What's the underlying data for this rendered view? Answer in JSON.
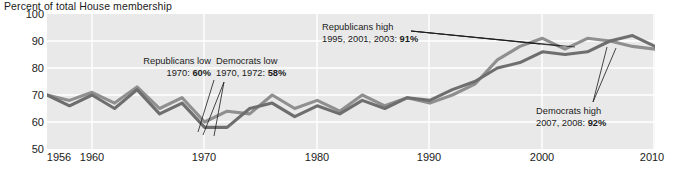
{
  "chart_data": {
    "type": "line",
    "title": "Percent of total House membership",
    "xlabel": "",
    "ylabel": "Percent of total House membership",
    "ylim": [
      50,
      100
    ],
    "xlim": [
      1956,
      2010
    ],
    "yticks": [
      100,
      90,
      80,
      70,
      60,
      50
    ],
    "xticks": [
      1956,
      1960,
      1970,
      1980,
      1990,
      2000,
      2010
    ],
    "grid": true,
    "legend": "none",
    "background": "#e9e9e9",
    "gridline_color": "#ffffff",
    "series": [
      {
        "name": "Republicans",
        "color": "#8f8f8f",
        "x": [
          1956,
          1958,
          1960,
          1962,
          1964,
          1966,
          1968,
          1970,
          1972,
          1974,
          1976,
          1978,
          1980,
          1982,
          1984,
          1986,
          1988,
          1990,
          1992,
          1994,
          1996,
          1998,
          2000,
          2002,
          2004,
          2006,
          2008,
          2010
        ],
        "values": [
          70,
          68,
          71,
          67,
          73,
          65,
          69,
          60,
          64,
          63,
          70,
          65,
          68,
          64,
          70,
          66,
          69,
          67,
          70,
          74,
          83,
          88,
          91,
          87,
          91,
          90,
          88,
          87
        ]
      },
      {
        "name": "Democrats",
        "color": "#6e6e6e",
        "x": [
          1956,
          1958,
          1960,
          1962,
          1964,
          1966,
          1968,
          1970,
          1972,
          1974,
          1976,
          1978,
          1980,
          1982,
          1984,
          1986,
          1988,
          1990,
          1992,
          1994,
          1996,
          1998,
          2000,
          2002,
          2004,
          2006,
          2008,
          2010
        ],
        "values": [
          70,
          66,
          70,
          65,
          72,
          63,
          67,
          58,
          58,
          65,
          67,
          62,
          66,
          63,
          68,
          65,
          69,
          68,
          72,
          75,
          80,
          82,
          86,
          85,
          86,
          90,
          92,
          88
        ]
      }
    ],
    "annotations": [
      {
        "id": "republicans-low",
        "line1": "Republicans low",
        "line2_prefix": "1970: ",
        "line2_value": "60%",
        "series": "Republicans",
        "year": 1970,
        "value": 60
      },
      {
        "id": "democrats-low",
        "line1": "Democrats low",
        "line2_prefix": "1970, 1972: ",
        "line2_value": "58%",
        "series": "Democrats",
        "year": 1970,
        "value": 58
      },
      {
        "id": "republicans-high",
        "line1": "Republicans high",
        "line2_prefix": "1995, 2001, 2003: ",
        "line2_value": "91%",
        "series": "Republicans",
        "year": 2001,
        "value": 91
      },
      {
        "id": "democrats-high",
        "line1": "Democrats high",
        "line2_prefix": "2007, 2008: ",
        "line2_value": "92%",
        "series": "Democrats",
        "year": 2008,
        "value": 92
      }
    ]
  },
  "axis": {
    "y_labels": [
      "100",
      "90",
      "80",
      "70",
      "60",
      "50"
    ],
    "x_labels": [
      "1956",
      "1960",
      "1970",
      "1980",
      "1990",
      "2000",
      "2010"
    ]
  },
  "annotations_text": {
    "republicans_low_l1": "Republicans low",
    "republicans_low_l2": "1970: ",
    "republicans_low_val": "60%",
    "democrats_low_l1": "Democrats low",
    "democrats_low_l2": "1970, 1972: ",
    "democrats_low_val": "58%",
    "republicans_high_l1": "Republicans high",
    "republicans_high_l2": "1995, 2001, 2003: ",
    "republicans_high_val": "91%",
    "democrats_high_l1": "Democrats high",
    "democrats_high_l2": "2007, 2008: ",
    "democrats_high_val": "92%"
  }
}
